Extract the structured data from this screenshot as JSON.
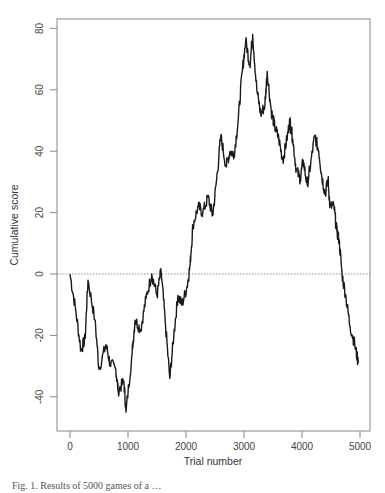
{
  "chart_data": {
    "type": "line",
    "title": "",
    "xlabel": "Trial number",
    "ylabel": "Cumulative score",
    "xlim": [
      -200,
      5150
    ],
    "ylim": [
      -51,
      83
    ],
    "x_ticks": [
      0,
      1000,
      2000,
      3000,
      4000,
      5000
    ],
    "x_tick_labels": [
      "0",
      "1000",
      "2000",
      "3000",
      "4000",
      "5000"
    ],
    "y_ticks": [
      -40,
      -20,
      0,
      20,
      40,
      60,
      80
    ],
    "y_tick_labels": [
      "-40",
      "-20",
      "0",
      "20",
      "40",
      "60",
      "80"
    ],
    "grid": false,
    "legend": null,
    "reference_line": {
      "y": 0,
      "style": "dotted"
    },
    "series": [
      {
        "name": "Cumulative score",
        "x": [
          0,
          100,
          190,
          260,
          310,
          430,
          500,
          620,
          690,
          790,
          830,
          930,
          965,
          1070,
          1120,
          1220,
          1310,
          1410,
          1500,
          1570,
          1640,
          1720,
          1790,
          1860,
          1930,
          2020,
          2070,
          2120,
          2210,
          2290,
          2380,
          2460,
          2530,
          2600,
          2690,
          2760,
          2830,
          2900,
          2970,
          3030,
          3100,
          3150,
          3220,
          3290,
          3360,
          3400,
          3470,
          3530,
          3600,
          3670,
          3740,
          3790,
          3840,
          3900,
          3970,
          4020,
          4090,
          4150,
          4220,
          4290,
          4340,
          4400,
          4450,
          4480,
          4550,
          4600,
          4640,
          4690,
          4760,
          4830,
          4910,
          4970
        ],
        "y": [
          0,
          -12,
          -25,
          -21,
          -2,
          -15,
          -31,
          -23,
          -29,
          -31,
          -38,
          -35,
          -45,
          -26,
          -15,
          -18,
          -8,
          0,
          -7,
          1,
          -15,
          -34,
          -20,
          -7,
          -10,
          -4,
          3,
          16,
          22,
          20,
          25,
          19,
          31,
          45,
          35,
          40,
          39,
          50,
          66,
          76,
          68,
          78,
          60,
          52,
          55,
          66,
          53,
          48,
          44,
          37,
          44,
          50,
          44,
          34,
          31,
          37,
          29,
          36,
          45,
          40,
          32,
          26,
          31,
          22,
          22,
          14,
          11,
          0,
          -8,
          -17,
          -23,
          -29
        ]
      }
    ]
  },
  "caption": "Fig. 1. Results of 5000 games of a …"
}
